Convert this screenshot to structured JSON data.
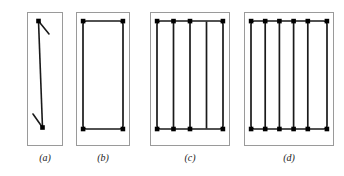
{
  "figure": {
    "type": "engineering-cross-section-diagram",
    "background_color": "#ffffff",
    "outline_color": "#9a9a9a",
    "bar_color": "#1a1a1a",
    "dot_color": "#000000",
    "panels": [
      {
        "id": "a",
        "label": "(a)",
        "left": 21,
        "width": 48,
        "frame": {
          "x": 6,
          "y": 12,
          "w": 36,
          "h": 134
        },
        "bar_count": 2,
        "tie_type": "single-diagonal-hooked-bar",
        "dots": 2,
        "vertical_lines": 1,
        "has_stirrup": false
      },
      {
        "id": "b",
        "label": "(b)",
        "left": 72,
        "width": 62,
        "frame": {
          "x": 4,
          "y": 12,
          "w": 54,
          "h": 134
        },
        "bar_count": 4,
        "tie_type": "single-rectangular-tie",
        "dots": 4,
        "vertical_lines": 2,
        "has_stirrup": true
      },
      {
        "id": "c",
        "label": "(c)",
        "left": 146,
        "width": 88,
        "frame": {
          "x": 4,
          "y": 12,
          "w": 80,
          "h": 134
        },
        "bar_count": 8,
        "tie_type": "rectangular-tie-with-three-interior-ties",
        "dots": 8,
        "vertical_lines": 4,
        "has_stirrup": true
      },
      {
        "id": "d",
        "label": "(d)",
        "left": 240,
        "width": 98,
        "frame": {
          "x": 4,
          "y": 12,
          "w": 90,
          "h": 134
        },
        "bar_count": 12,
        "tie_type": "rectangular-tie-with-five-interior-ties",
        "dots": 12,
        "vertical_lines": 6,
        "has_stirrup": true
      }
    ],
    "labels": {
      "a": "(a)",
      "b": "(b)",
      "c": "(c)",
      "d": "(d)"
    }
  }
}
